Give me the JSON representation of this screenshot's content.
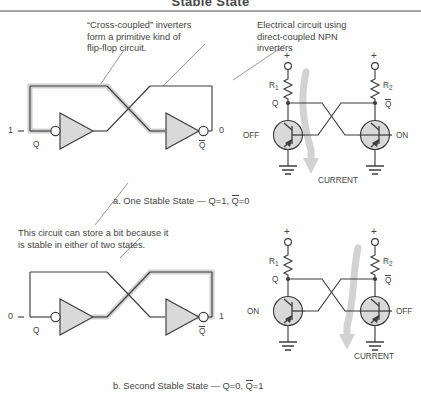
{
  "title": "Stable State",
  "annotations": {
    "left_note": "“Cross-coupled” inverters\nform a primitive kind of\nflip-flop circuit.",
    "right_note": "Electrical circuit using\ndirect-coupled NPN\ninverters",
    "middle_note": "This circuit can store a bit because it\nis stable in either of two states."
  },
  "captions": {
    "a_prefix": "a. One Stable State — Q=1, ",
    "a_suffix": "=0",
    "b_prefix": "b. Second Stable State — Q=0, ",
    "b_suffix": "=1"
  },
  "logic_top": {
    "input_value": "1",
    "output_value": "0",
    "left_inverter_label": "Q",
    "right_inverter_label": "Q",
    "right_inverter_overbar": true
  },
  "logic_bottom": {
    "input_value": "0",
    "output_value": "1",
    "left_inverter_label": "Q",
    "right_inverter_label": "Q",
    "right_inverter_overbar": true
  },
  "circuit_top": {
    "supply_symbol": "+",
    "r1_label": "R",
    "r1_sub": "1",
    "r2_label": "R",
    "r2_sub": "2",
    "node_left_label": "Q",
    "node_right_label": "Q",
    "left_transistor_state": "OFF",
    "right_transistor_state": "ON",
    "current_label": "CURRENT"
  },
  "circuit_bottom": {
    "supply_symbol": "+",
    "r1_label": "R",
    "r1_sub": "1",
    "r2_label": "R",
    "r2_sub": "2",
    "node_left_label": "Q",
    "node_right_label": "Q",
    "left_transistor_state": "ON",
    "right_transistor_state": "OFF",
    "current_label": "CURRENT"
  },
  "colors": {
    "ink": "#454545",
    "wire": "#3d3d3d",
    "highlight": "#d2d2d2",
    "fill": "#d9d9d9",
    "rule": "#7a7a7a"
  }
}
